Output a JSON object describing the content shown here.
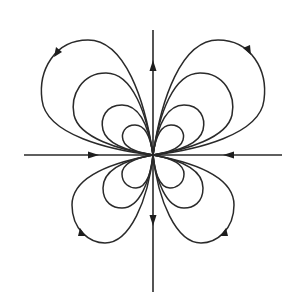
{
  "diagram": {
    "title": "Dipole-like field line pattern (butterfly)",
    "caption": "",
    "center": [
      153,
      155
    ],
    "colors": {
      "line": "#2a2a2a",
      "arrow": "#1e1e1e",
      "background": "#ffffff"
    },
    "axes": {
      "vertical": {
        "from": [
          153,
          30
        ],
        "to": [
          153,
          292
        ],
        "arrows": [
          {
            "at": [
              153,
              68
            ],
            "direction": "up"
          },
          {
            "at": [
              153,
              218
            ],
            "direction": "down"
          }
        ]
      },
      "horizontal": {
        "from": [
          24,
          155
        ],
        "to": [
          282,
          155
        ],
        "arrows": [
          {
            "at": [
              92,
              155
            ],
            "direction": "right"
          },
          {
            "at": [
              230,
              155
            ],
            "direction": "left"
          }
        ]
      }
    },
    "loops": {
      "upper_left_count": 4,
      "upper_right_count": 4,
      "lower_left_count": 3,
      "lower_right_count": 3
    },
    "loop_arrows": [
      {
        "quadrant": "upper-left",
        "at": [
          58,
          52
        ],
        "direction": "down-left"
      },
      {
        "quadrant": "upper-right",
        "at": [
          248,
          50
        ],
        "direction": "down-right"
      },
      {
        "quadrant": "lower-left",
        "at": [
          82,
          232
        ],
        "direction": "up-left"
      },
      {
        "quadrant": "lower-right",
        "at": [
          222,
          232
        ],
        "direction": "up-right"
      }
    ]
  }
}
